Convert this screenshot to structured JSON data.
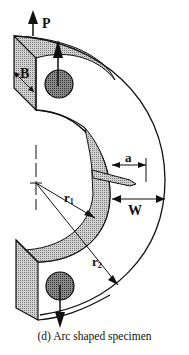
{
  "diagram": {
    "caption": "(d)  Arc shaped specimen",
    "labels": {
      "load": "P",
      "thickness": "B",
      "crack_length": "a",
      "width": "W",
      "inner_radius": "r",
      "inner_radius_sub": "1",
      "outer_radius": "r",
      "outer_radius_sub": "2"
    },
    "colors": {
      "stroke": "#111111",
      "shade": "#b5b5b5",
      "hole": "#6a6a6a",
      "background": "#ffffff"
    }
  }
}
